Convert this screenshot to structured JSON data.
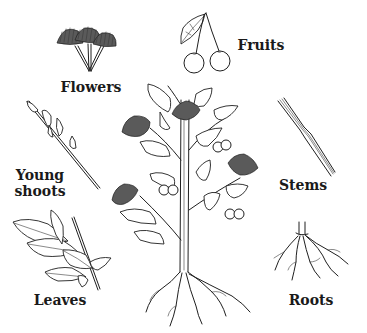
{
  "diagram": {
    "labels": {
      "flowers": "Flowers",
      "fruits": "Fruits",
      "young_shoots_line1": "Young",
      "young_shoots_line2": "shoots",
      "stems": "Stems",
      "leaves": "Leaves",
      "roots": "Roots"
    },
    "colors": {
      "background": "#ffffff",
      "ink": "#1f1f1f",
      "label_text": "#1a1a1a"
    }
  }
}
